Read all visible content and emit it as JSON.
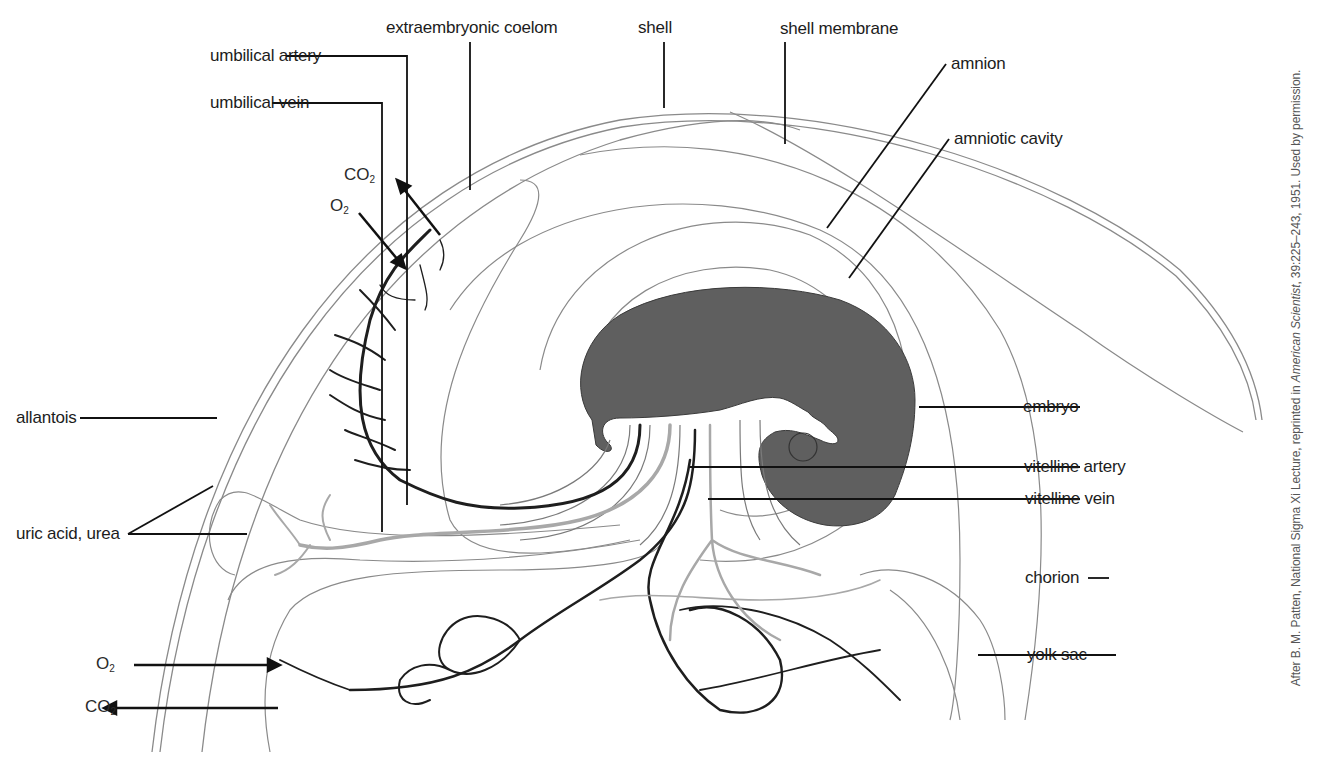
{
  "figure": {
    "labels": {
      "extraembryonic_coelom": "extraembryonic coelom",
      "shell": "shell",
      "shell_membrane": "shell membrane",
      "umbilical_artery": "umbilical artery",
      "umbilical_vein": "umbilical vein",
      "amnion": "amnion",
      "amniotic_cavity": "amniotic cavity",
      "allantois": "allantois",
      "uric_acid_urea": "uric acid, urea",
      "embryo": "embryo",
      "vitelline_artery": "vitelline artery",
      "vitelline_vein": "vitelline vein",
      "chorion": "chorion",
      "yolk_sac": "yolk sac"
    },
    "gas_exchange": {
      "top": {
        "co2": "CO",
        "co2_sub": "2",
        "o2": "O",
        "o2_sub": "2"
      },
      "bottom": {
        "o2": "O",
        "o2_sub": "2",
        "co2": "CO",
        "co2_sub": "2"
      }
    },
    "credit": {
      "prefix": "After B. M. Patten, National Sigma Xi Lecture, reprinted in ",
      "journal": "American Scientist",
      "suffix": ", 39:225–243, 1951. Used by permission."
    },
    "colors": {
      "embryo_fill": "#5f5f5f",
      "membrane_line": "#8a8a8a",
      "artery": "#1e1e1e",
      "vein": "#a8a8a8",
      "leader": "#111111"
    }
  }
}
